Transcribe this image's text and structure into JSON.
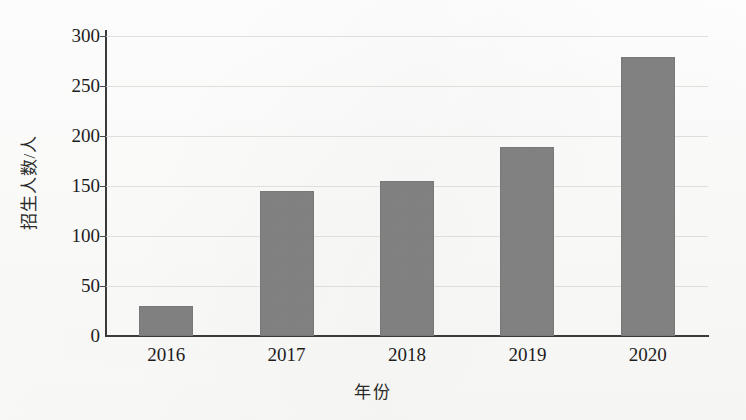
{
  "chart_data": {
    "type": "bar",
    "title": "",
    "subtitle": "",
    "xlabel": "年份",
    "ylabel": "招生人数/人",
    "categories": [
      "2016",
      "2017",
      "2018",
      "2019",
      "2020"
    ],
    "values": [
      30,
      145,
      155,
      188,
      278
    ],
    "series": [
      {
        "name": "招生人数",
        "values": [
          30,
          145,
          155,
          188,
          278
        ]
      }
    ],
    "ylim": [
      0,
      300
    ],
    "ytick_labels": [
      "0",
      "50",
      "100",
      "150",
      "200",
      "250",
      "300"
    ],
    "ytick_values": [
      0,
      50,
      100,
      150,
      200,
      250,
      300
    ],
    "grid": true,
    "legend": false,
    "legend_position": "none",
    "bar_color": "#808080",
    "axis_color": "#3a3a3a",
    "gridline_color": "#d9d9d6",
    "background_color": "#ffffff",
    "annotations": []
  }
}
